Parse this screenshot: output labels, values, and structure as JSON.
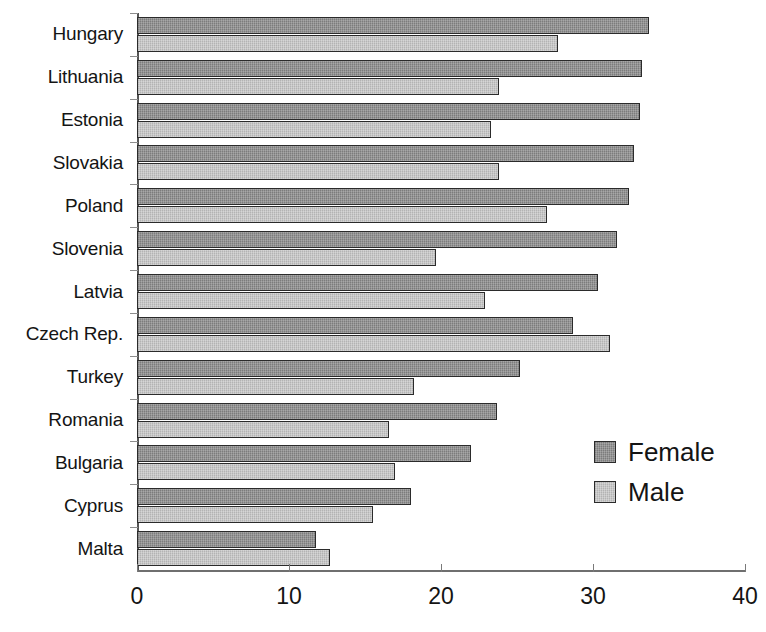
{
  "chart_data": {
    "type": "bar",
    "orientation": "horizontal",
    "title": "",
    "subtitle": "",
    "xlabel": "",
    "ylabel": "",
    "xlim": [
      0,
      40
    ],
    "xticks": [
      0,
      10,
      20,
      30,
      40
    ],
    "xtick_labels": [
      "0",
      "10",
      "20",
      "30",
      "40"
    ],
    "grid": false,
    "legend_position": "inside-right",
    "categories": [
      "Hungary",
      "Lithuania",
      "Estonia",
      "Slovakia",
      "Poland",
      "Slovenia",
      "Latvia",
      "Czech Rep.",
      "Turkey",
      "Romania",
      "Bulgaria",
      "Cyprus",
      "Malta"
    ],
    "series": [
      {
        "name": "Female",
        "color": "#8a8a8a",
        "values": [
          33.7,
          33.2,
          33.1,
          32.7,
          32.4,
          31.6,
          30.3,
          28.7,
          25.2,
          23.7,
          22.0,
          18.0,
          11.8
        ]
      },
      {
        "name": "Male",
        "color": "#c2c2c2",
        "values": [
          27.7,
          23.8,
          23.3,
          23.8,
          27.0,
          19.7,
          22.9,
          31.1,
          18.2,
          16.6,
          17.0,
          15.5,
          12.7
        ]
      }
    ]
  },
  "legend": {
    "items": [
      {
        "label": "Female",
        "swatch": "female"
      },
      {
        "label": "Male",
        "swatch": "male"
      }
    ]
  }
}
